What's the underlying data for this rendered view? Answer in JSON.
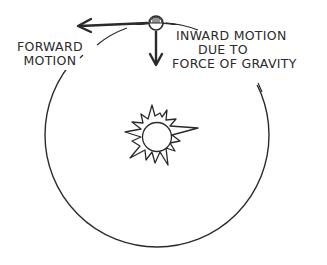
{
  "diagram": {
    "type": "orbit-illustration",
    "labels": {
      "forward_motion": [
        "FORWARD",
        "MOTION"
      ],
      "inward_motion": [
        "INWARD MOTION",
        "DUE TO",
        "FORCE OF GRAVITY"
      ]
    },
    "elements": {
      "central_body": "sun",
      "orbiting_body": "planet",
      "orbit_path": "circle",
      "arrows": [
        "forward-motion-arrow",
        "inward-gravity-arrow"
      ]
    },
    "colors": {
      "stroke": "#2a2a2a",
      "background": "#ffffff"
    }
  }
}
